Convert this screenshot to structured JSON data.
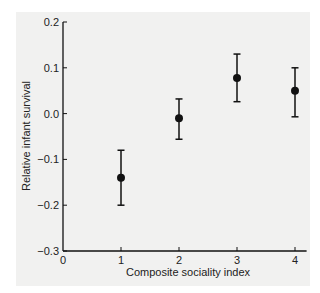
{
  "chart_data": {
    "type": "scatter",
    "title": "",
    "xlabel": "Composite sociality index",
    "ylabel": "Relative infant survival",
    "xlim": [
      0,
      4.2
    ],
    "ylim": [
      -0.3,
      0.2
    ],
    "x_ticks": [
      "0",
      "1",
      "2",
      "3",
      "4"
    ],
    "y_ticks": [
      "0.2",
      "0.1",
      "0.0",
      "−0.1",
      "−0.2",
      "−0.3"
    ],
    "grid": false,
    "legend": null,
    "error_bars": true,
    "series": [
      {
        "name": "Relative infant survival",
        "x": [
          1,
          2,
          3,
          4
        ],
        "y": [
          -0.14,
          -0.01,
          0.078,
          0.05
        ],
        "err_low": [
          -0.2,
          -0.056,
          0.026,
          -0.007
        ],
        "err_high": [
          -0.08,
          0.032,
          0.13,
          0.1
        ]
      }
    ]
  },
  "colors": {
    "background": "#f1f1f0",
    "ink": "#111111"
  }
}
